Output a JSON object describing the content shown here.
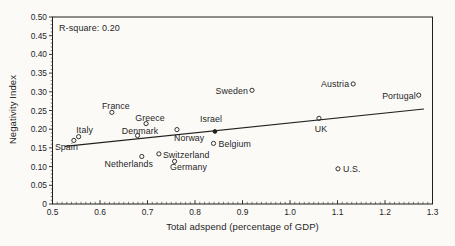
{
  "figure": {
    "background": "#fbfaf7",
    "ink": "#1f1f1f"
  },
  "chart_data": {
    "type": "scatter",
    "title": "",
    "xlabel": "Total adspend (percentage of GDP)",
    "ylabel": "Negativity Index",
    "annotation": "R-square: 0.20",
    "xlim": [
      0.5,
      1.3
    ],
    "ylim": [
      0,
      0.5
    ],
    "grid": "off",
    "x_ticks": {
      "values": [
        0.5,
        0.6,
        0.7,
        0.8,
        0.9,
        1.0,
        1.1,
        1.2,
        1.3
      ],
      "labels": [
        "0.5",
        "0.6",
        "0.7",
        "0.8",
        "0.9",
        "1.0",
        "1.1",
        "1.2",
        "1.3"
      ]
    },
    "y_ticks": {
      "values": [
        0,
        0.05,
        0.1,
        0.15,
        0.2,
        0.25,
        0.3,
        0.35,
        0.4,
        0.45,
        0.5
      ],
      "labels": [
        "0",
        "0.05",
        "0.10",
        "0.15",
        "0.20",
        "0.25",
        "0.30",
        "0.35",
        "0.40",
        "0.45",
        "0.50"
      ]
    },
    "x_minor_step": 0.01,
    "y_minor_step": 0.01,
    "trend_line": {
      "x1": 0.526,
      "y1": 0.154,
      "x2": 1.282,
      "y2": 0.254
    },
    "points": [
      {
        "country": "Spain",
        "x": 0.545,
        "y": 0.17,
        "marker": "open",
        "anchor": "start",
        "dx": -19,
        "dy": 9.5
      },
      {
        "country": "Italy",
        "x": 0.555,
        "y": 0.18,
        "marker": "open",
        "anchor": "middle",
        "dx": 6,
        "dy": -3.5
      },
      {
        "country": "France",
        "x": 0.625,
        "y": 0.245,
        "marker": "open",
        "anchor": "middle",
        "dx": 4,
        "dy": -3
      },
      {
        "country": "Denmark",
        "x": 0.679,
        "y": 0.183,
        "marker": "open",
        "anchor": "middle",
        "dx": 2.5,
        "dy": -2
      },
      {
        "country": "Netherlands",
        "x": 0.688,
        "y": 0.127,
        "marker": "open",
        "anchor": "middle",
        "dx": -13,
        "dy": 10.5
      },
      {
        "country": "Greece",
        "x": 0.697,
        "y": 0.215,
        "marker": "open",
        "anchor": "middle",
        "dx": 4,
        "dy": -2.5
      },
      {
        "country": "Switzerland",
        "x": 0.724,
        "y": 0.134,
        "marker": "open",
        "anchor": "start",
        "dx": 4,
        "dy": 4.5
      },
      {
        "country": "Germany",
        "x": 0.757,
        "y": 0.114,
        "marker": "open",
        "anchor": "start",
        "dx": -4.5,
        "dy": 9
      },
      {
        "country": "Norway",
        "x": 0.762,
        "y": 0.199,
        "marker": "open",
        "anchor": "start",
        "dx": -3,
        "dy": 11.5
      },
      {
        "country": "Israel",
        "x": 0.842,
        "y": 0.194,
        "marker": "filled",
        "anchor": "middle",
        "dx": -4,
        "dy": -9.5
      },
      {
        "country": "Belgium",
        "x": 0.839,
        "y": 0.162,
        "marker": "open",
        "anchor": "start",
        "dx": 5,
        "dy": 3.5
      },
      {
        "country": "Sweden",
        "x": 0.92,
        "y": 0.304,
        "marker": "open",
        "anchor": "end",
        "dx": -4,
        "dy": 3.5
      },
      {
        "country": "UK",
        "x": 1.061,
        "y": 0.229,
        "marker": "open",
        "anchor": "middle",
        "dx": 2,
        "dy": 13.5
      },
      {
        "country": "U.S.",
        "x": 1.101,
        "y": 0.094,
        "marker": "open",
        "anchor": "start",
        "dx": 5,
        "dy": 3.5
      },
      {
        "country": "Austria",
        "x": 1.133,
        "y": 0.321,
        "marker": "open",
        "anchor": "end",
        "dx": -4,
        "dy": 3
      },
      {
        "country": "Portugal",
        "x": 1.271,
        "y": 0.291,
        "marker": "open",
        "anchor": "end",
        "dx": -3,
        "dy": 3.5
      }
    ]
  }
}
